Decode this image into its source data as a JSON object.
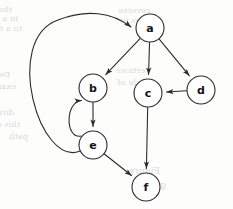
{
  "figure": {
    "type": "directed-graph",
    "width": 233,
    "height": 209,
    "background_color": "#fdfdfc",
    "stroke_color": "#2b2b2b",
    "node_fill_color": "#ffffff",
    "label_color": "#141414",
    "node_radius": 14
  },
  "nodes": [
    {
      "id": "a",
      "label": "a",
      "x": 150,
      "y": 28
    },
    {
      "id": "b",
      "label": "b",
      "x": 93,
      "y": 88
    },
    {
      "id": "c",
      "label": "c",
      "x": 148,
      "y": 93
    },
    {
      "id": "d",
      "label": "d",
      "x": 201,
      "y": 90
    },
    {
      "id": "e",
      "label": "e",
      "x": 93,
      "y": 145
    },
    {
      "id": "f",
      "label": "f",
      "x": 146,
      "y": 187
    }
  ],
  "edges": [
    {
      "id": "a-b",
      "from": "a",
      "to": "b",
      "shape": "straight",
      "directed": true
    },
    {
      "id": "a-c",
      "from": "a",
      "to": "c",
      "shape": "straight",
      "directed": true
    },
    {
      "id": "a-d",
      "from": "a",
      "to": "d",
      "shape": "straight",
      "directed": true
    },
    {
      "id": "d-c",
      "from": "d",
      "to": "c",
      "shape": "straight",
      "directed": true
    },
    {
      "id": "b-e",
      "from": "b",
      "to": "e",
      "shape": "straight",
      "directed": true
    },
    {
      "id": "e-b",
      "from": "e",
      "to": "b",
      "shape": "curved-left",
      "directed": true
    },
    {
      "id": "c-f",
      "from": "c",
      "to": "f",
      "shape": "straight",
      "directed": true
    },
    {
      "id": "e-f",
      "from": "e",
      "to": "f",
      "shape": "straight",
      "directed": true
    },
    {
      "id": "e-a",
      "from": "e",
      "to": "a",
      "shape": "wide-arc-left",
      "directed": true
    }
  ],
  "adjacency_summary": [
    "a -> b",
    "a -> c",
    "a -> d",
    "d -> c",
    "b -> e",
    "e -> b",
    "c -> f",
    "e -> f",
    "e -> a"
  ],
  "background_bleed": {
    "note": "faint mirrored show-through text from reverse of scanned page",
    "color": "#b9bdc4",
    "lines": [
      {
        "text": "the graph",
        "x": 12,
        "y": 5,
        "size": 8
      },
      {
        "text": "in a graph",
        "x": 18,
        "y": 14,
        "size": 8
      },
      {
        "text": "to a node",
        "x": 22,
        "y": 24,
        "size": 8
      },
      {
        "text": "reverse",
        "x": 150,
        "y": 6,
        "size": 8
      },
      {
        "text": "nodes in",
        "x": 156,
        "y": 16,
        "size": 8
      },
      {
        "text": "Definition",
        "x": 10,
        "y": 70,
        "size": 8
      },
      {
        "text": "example",
        "x": 16,
        "y": 82,
        "size": 8
      },
      {
        "text": "vertices",
        "x": 150,
        "y": 66,
        "size": 8
      },
      {
        "text": "cycle of",
        "x": 150,
        "y": 78,
        "size": 8
      },
      {
        "text": "directed",
        "x": 14,
        "y": 108,
        "size": 8
      },
      {
        "text": "this edge",
        "x": 20,
        "y": 120,
        "size": 8
      },
      {
        "text": "path",
        "x": 28,
        "y": 132,
        "size": 8
      },
      {
        "text": "Figure",
        "x": 160,
        "y": 166,
        "size": 9
      },
      {
        "text": "graph",
        "x": 166,
        "y": 180,
        "size": 9
      }
    ]
  }
}
